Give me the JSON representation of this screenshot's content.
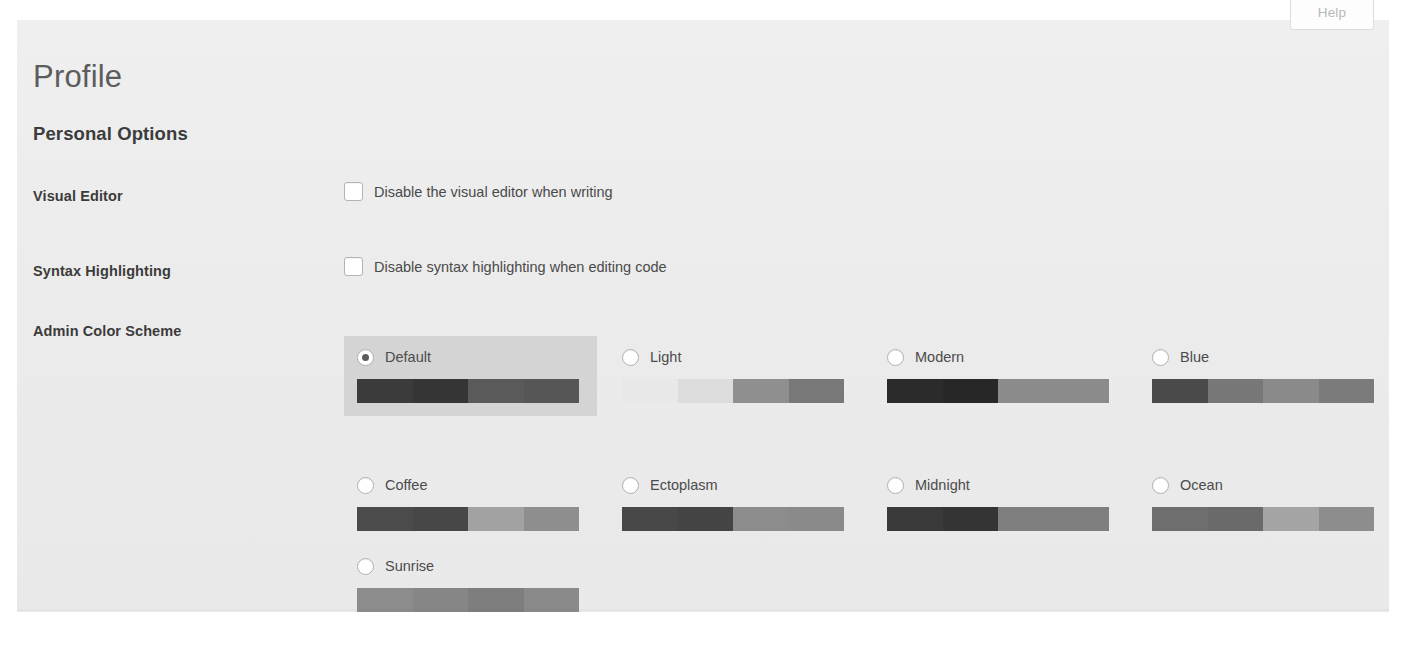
{
  "help_tab": {
    "label": "Help"
  },
  "page": {
    "title": "Profile",
    "section_title": "Personal Options"
  },
  "rows": [
    {
      "label": "Visual Editor",
      "option_text": "Disable the visual editor when writing",
      "checked": false
    },
    {
      "label": "Syntax Highlighting",
      "option_text": "Disable syntax highlighting when editing code",
      "checked": false
    },
    {
      "label": "Admin Color Scheme"
    }
  ],
  "color_schemes": {
    "label": "Admin Color Scheme",
    "selected": "Default",
    "items": [
      {
        "name": "Default",
        "selected": true,
        "colors": [
          "#3b3b3b",
          "#353535",
          "#5a5a5a",
          "#565656"
        ]
      },
      {
        "name": "Light",
        "selected": false,
        "colors": [
          "#e8e8e8",
          "#dcdcdc",
          "#8f8f8f",
          "#787878"
        ]
      },
      {
        "name": "Modern",
        "selected": false,
        "colors": [
          "#2b2b2b",
          "#272727",
          "#8b8b8b",
          "#8b8b8b"
        ]
      },
      {
        "name": "Blue",
        "selected": false,
        "colors": [
          "#4a4a4a",
          "#777777",
          "#8a8a8a",
          "#7b7b7b"
        ]
      },
      {
        "name": "Coffee",
        "selected": false,
        "colors": [
          "#4b4b4b",
          "#474747",
          "#a2a2a2",
          "#8e8e8e"
        ]
      },
      {
        "name": "Ectoplasm",
        "selected": false,
        "colors": [
          "#484848",
          "#444444",
          "#8c8c8c",
          "#8a8a8a"
        ]
      },
      {
        "name": "Midnight",
        "selected": false,
        "colors": [
          "#3a3a3a",
          "#343434",
          "#7f7f7f",
          "#7f7f7f"
        ]
      },
      {
        "name": "Ocean",
        "selected": false,
        "colors": [
          "#6e6e6e",
          "#6a6a6a",
          "#a4a4a4",
          "#8d8d8d"
        ]
      },
      {
        "name": "Sunrise",
        "selected": false,
        "colors": [
          "#8c8c8c",
          "#868686",
          "#7e7e7e",
          "#8a8a8a"
        ]
      }
    ]
  }
}
